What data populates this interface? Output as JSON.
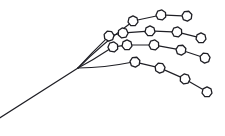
{
  "figure": {
    "width": 225,
    "height": 136,
    "background_color": "#ffffff",
    "stroke_color": "#1f1f25",
    "node_fill_color": "#ffffff",
    "node_shape": "heptagon",
    "node_radius": 5.1,
    "root_label": "root-junction",
    "tail_label": "root-tail-stem"
  },
  "chart_data": {
    "type": "scatter",
    "subtitle": "",
    "xlabel": "",
    "ylabel": "",
    "xlim": [
      0,
      225
    ],
    "ylim": [
      0,
      136
    ],
    "grid": false,
    "legend": "none",
    "annotations": [],
    "root": {
      "id": "root",
      "x": 78,
      "y": 68
    },
    "tail": {
      "id": "tail-end",
      "x": -2,
      "y": 119
    },
    "branch_count": 4,
    "node_count": 17,
    "series": [
      {
        "name": "branch-1-upper",
        "values": [
          {
            "id": "b1n1",
            "x": 133,
            "y": 21
          },
          {
            "id": "b1n2",
            "x": 161,
            "y": 15
          },
          {
            "id": "b1n3",
            "x": 187,
            "y": 16
          }
        ]
      },
      {
        "name": "branch-2-upper-mid",
        "values": [
          {
            "id": "b2n1",
            "x": 109,
            "y": 36
          },
          {
            "id": "b2n2",
            "x": 123,
            "y": 33
          },
          {
            "id": "b2n3",
            "x": 150,
            "y": 31
          },
          {
            "id": "b2n4",
            "x": 177,
            "y": 32
          },
          {
            "id": "b2n5",
            "x": 201,
            "y": 38
          }
        ]
      },
      {
        "name": "branch-3-lower-mid",
        "values": [
          {
            "id": "b3n1",
            "x": 113,
            "y": 47
          },
          {
            "id": "b3n2",
            "x": 127,
            "y": 45
          },
          {
            "id": "b3n3",
            "x": 154,
            "y": 45
          },
          {
            "id": "b3n4",
            "x": 181,
            "y": 50
          },
          {
            "id": "b3n5",
            "x": 205,
            "y": 58
          }
        ]
      },
      {
        "name": "branch-4-lower",
        "values": [
          {
            "id": "b4n1",
            "x": 135,
            "y": 62
          },
          {
            "id": "b4n2",
            "x": 160,
            "y": 68
          },
          {
            "id": "b4n3",
            "x": 185,
            "y": 79
          },
          {
            "id": "b4n4",
            "x": 207,
            "y": 92
          }
        ]
      }
    ]
  }
}
